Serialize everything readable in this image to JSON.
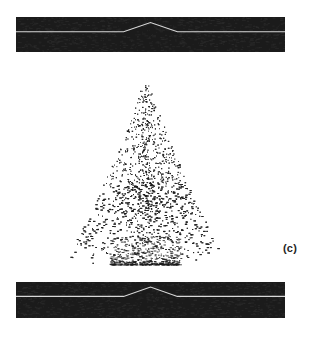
{
  "figure": {
    "panel_label": "(c)",
    "background_color": "#ffffff",
    "bar_color": "#1b1b1b",
    "profile_line_color": "#d8d8d8",
    "dot_color": "#1a1a1a"
  },
  "top_bar": {
    "name": "top interface bar",
    "x": 16,
    "y": 17,
    "width": 269,
    "height": 35,
    "baseline_y_frac": 0.42,
    "bump_start_frac": 0.4,
    "bump_peak_frac": 0.5,
    "bump_end_frac": 0.6,
    "bump_height_frac": 0.26
  },
  "bottom_bar": {
    "name": "bottom interface bar",
    "x": 16,
    "y": 282,
    "width": 269,
    "height": 36,
    "baseline_y_frac": 0.4,
    "bump_start_frac": 0.4,
    "bump_peak_frac": 0.5,
    "bump_end_frac": 0.6,
    "bump_height_frac": 0.26
  },
  "chart_data": {
    "type": "scatter",
    "title": "",
    "subtitle": "",
    "xlabel": "",
    "ylabel": "",
    "annotations": [
      "(c)"
    ],
    "grid": false,
    "legend": null,
    "xlim": [
      -1,
      1
    ],
    "ylim": [
      0,
      1
    ],
    "apex_x": 0.03,
    "apex_y": 1.0,
    "base_half_width": 0.92,
    "base_y": 0.0,
    "n_points": 3400,
    "density_profile": [
      {
        "y": 1.0,
        "relative_density": 0.02,
        "half_width": 0.07
      },
      {
        "y": 0.9,
        "relative_density": 0.05,
        "half_width": 0.13
      },
      {
        "y": 0.8,
        "relative_density": 0.09,
        "half_width": 0.2
      },
      {
        "y": 0.7,
        "relative_density": 0.15,
        "half_width": 0.28
      },
      {
        "y": 0.6,
        "relative_density": 0.24,
        "half_width": 0.37
      },
      {
        "y": 0.5,
        "relative_density": 0.36,
        "half_width": 0.46
      },
      {
        "y": 0.4,
        "relative_density": 0.5,
        "half_width": 0.55
      },
      {
        "y": 0.3,
        "relative_density": 0.66,
        "half_width": 0.65
      },
      {
        "y": 0.2,
        "relative_density": 0.81,
        "half_width": 0.75
      },
      {
        "y": 0.1,
        "relative_density": 0.93,
        "half_width": 0.85
      },
      {
        "y": 0.0,
        "relative_density": 1.0,
        "half_width": 0.92
      }
    ]
  }
}
